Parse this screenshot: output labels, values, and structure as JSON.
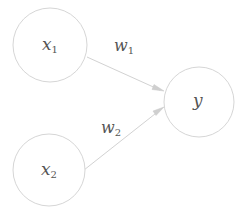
{
  "diagram": {
    "type": "neural-network-perceptron",
    "nodes": [
      {
        "id": "x1",
        "label": "x",
        "subscript": "1",
        "role": "input"
      },
      {
        "id": "x2",
        "label": "x",
        "subscript": "2",
        "role": "input"
      },
      {
        "id": "y",
        "label": "y",
        "subscript": "",
        "role": "output"
      }
    ],
    "edges": [
      {
        "from": "x1",
        "to": "y",
        "label": "w",
        "subscript": "1"
      },
      {
        "from": "x2",
        "to": "y",
        "label": "w",
        "subscript": "2"
      }
    ],
    "colors": {
      "node_stroke": "#d6d6d6",
      "edge_stroke": "#d2d2d2",
      "text": "#555555",
      "background": "#ffffff"
    }
  }
}
